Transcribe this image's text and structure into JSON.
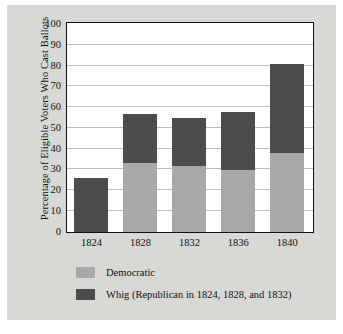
{
  "chart_data": {
    "type": "bar",
    "subtype": "stacked",
    "title": "",
    "xlabel": "",
    "ylabel": "Percentage of Eligible Voters Who Cast Ballots",
    "categories": [
      "1824",
      "1828",
      "1832",
      "1836",
      "1840"
    ],
    "ylim": [
      0,
      100
    ],
    "yticks": [
      0,
      10,
      20,
      30,
      40,
      50,
      60,
      70,
      80,
      90,
      100
    ],
    "ytick_labels": [
      "0",
      "10",
      "20",
      "30",
      "40",
      "50",
      "60",
      "70",
      "80",
      "90",
      "100"
    ],
    "grid": true,
    "legend_position": "below",
    "series": [
      {
        "name": "Democratic",
        "color": "#a8a8a8",
        "values": [
          0,
          33,
          32,
          30,
          38
        ]
      },
      {
        "name": "Whig (Republican in 1824, 1828, and 1832)",
        "color": "#4c4c4c",
        "values": [
          26,
          24,
          23,
          28,
          43
        ]
      }
    ],
    "totals": [
      26,
      57,
      55,
      58,
      81
    ]
  },
  "legend": {
    "items": [
      {
        "label": "Democratic",
        "color": "#a8a8a8"
      },
      {
        "label": "Whig (Republican in 1824, 1828, and 1832)",
        "color": "#4c4c4c"
      }
    ]
  }
}
